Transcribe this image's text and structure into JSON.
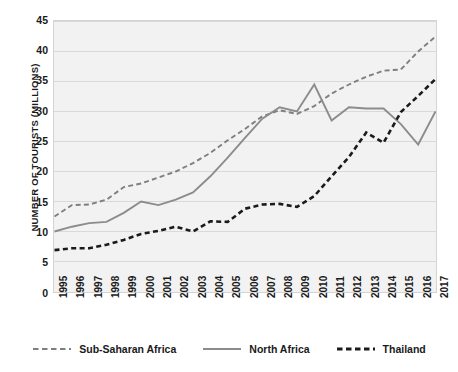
{
  "chart_data": {
    "type": "line",
    "title": "",
    "xlabel": "",
    "ylabel": "NUMBER OF TOURISTS (MILLIONS)",
    "xlim": [
      1995,
      2017
    ],
    "ylim": [
      0,
      45
    ],
    "ytick_step": 5,
    "grid": true,
    "legend_position": "bottom",
    "categories": [
      "1995",
      "1996",
      "1997",
      "1998",
      "1999",
      "2000",
      "2001",
      "2002",
      "2003",
      "2004",
      "2005",
      "2006",
      "2007",
      "2008",
      "2009",
      "2010",
      "2011",
      "2012",
      "2013",
      "2014",
      "2015",
      "2016",
      "2017"
    ],
    "yticks": [
      "0",
      "5",
      "10",
      "15",
      "20",
      "25",
      "30",
      "35",
      "40",
      "45"
    ],
    "series": [
      {
        "name": "Sub-Saharan Africa",
        "color": "#7f7f7f",
        "style": "dashed",
        "values": [
          12.5,
          14.4,
          14.5,
          15.3,
          17.4,
          18.0,
          19.0,
          20.0,
          21.4,
          23.1,
          25.2,
          27.1,
          29.2,
          30.2,
          29.6,
          30.9,
          33.0,
          34.5,
          35.8,
          36.8,
          37.0,
          40.0,
          42.5
        ]
      },
      {
        "name": "North Africa",
        "color": "#8c8c8c",
        "style": "solid",
        "values": [
          10.0,
          10.8,
          11.4,
          11.6,
          13.1,
          15.0,
          14.4,
          15.3,
          16.5,
          19.2,
          22.3,
          25.6,
          28.8,
          30.7,
          30.0,
          34.5,
          28.5,
          30.7,
          30.5,
          30.5,
          27.9,
          24.5,
          30.0
        ]
      },
      {
        "name": "Thailand",
        "color": "#1a1a1a",
        "style": "dashed",
        "values": [
          6.9,
          7.2,
          7.2,
          7.8,
          8.6,
          9.6,
          10.1,
          10.8,
          10.0,
          11.7,
          11.6,
          13.8,
          14.5,
          14.6,
          14.1,
          15.9,
          19.2,
          22.4,
          26.5,
          24.8,
          29.9,
          32.6,
          35.4
        ]
      }
    ],
    "legend": [
      {
        "label": "Sub-Saharan Africa",
        "color": "#7f7f7f",
        "style": "dashed"
      },
      {
        "label": "North Africa",
        "color": "#8c8c8c",
        "style": "solid"
      },
      {
        "label": "Thailand",
        "color": "#1a1a1a",
        "style": "dashed"
      }
    ]
  }
}
